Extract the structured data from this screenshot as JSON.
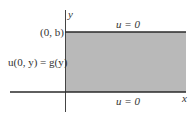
{
  "diagram": {
    "colors": {
      "region_fill": "#b9b9b9",
      "edge": "#2a2a2a",
      "axis": "#444444",
      "text": "#333333"
    },
    "axes": {
      "x_label": "x",
      "y_label": "y"
    },
    "points": {
      "corner_label": "(0, b)"
    },
    "boundary_conditions": {
      "top": "u = 0",
      "bottom": "u = 0",
      "left": "u(0, y) = g(y)"
    }
  }
}
